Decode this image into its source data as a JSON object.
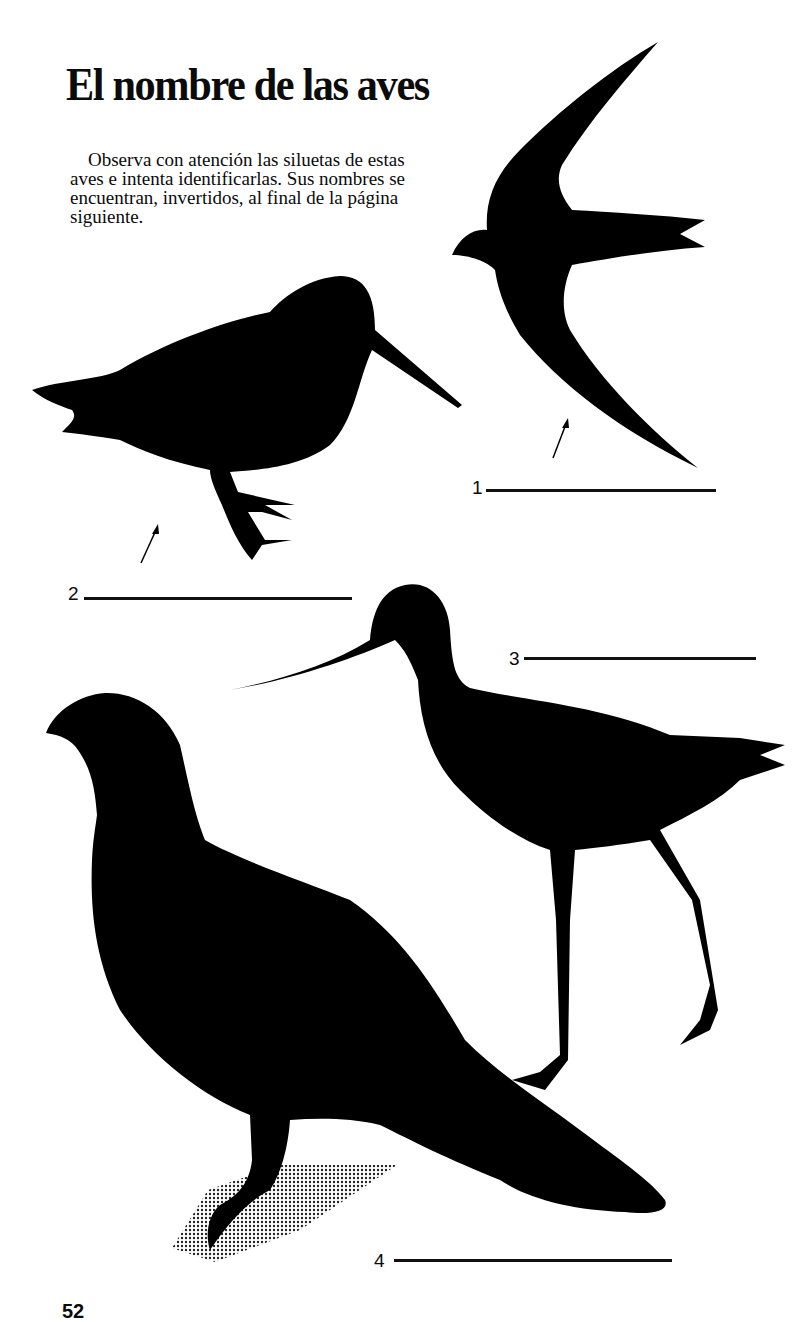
{
  "page": {
    "title": "El nombre de las aves",
    "intro": "Observa con atención las siluetas de estas aves e intenta identificarlas. Sus nombres se encuentran, invertidos, al final de la página siguiente.",
    "page_number": "52"
  },
  "answers": [
    {
      "number": "1",
      "value": ""
    },
    {
      "number": "2",
      "value": ""
    },
    {
      "number": "3",
      "value": ""
    },
    {
      "number": "4",
      "value": ""
    }
  ],
  "silhouettes": [
    {
      "id": 1,
      "description": "flying swift silhouette",
      "color": "#000000"
    },
    {
      "id": 2,
      "description": "woodcock silhouette with long straight bill",
      "color": "#000000"
    },
    {
      "id": 3,
      "description": "wader with long downcurved bill and long legs",
      "color": "#000000"
    },
    {
      "id": 4,
      "description": "grouse silhouette with halftone shadow",
      "color": "#000000"
    }
  ]
}
